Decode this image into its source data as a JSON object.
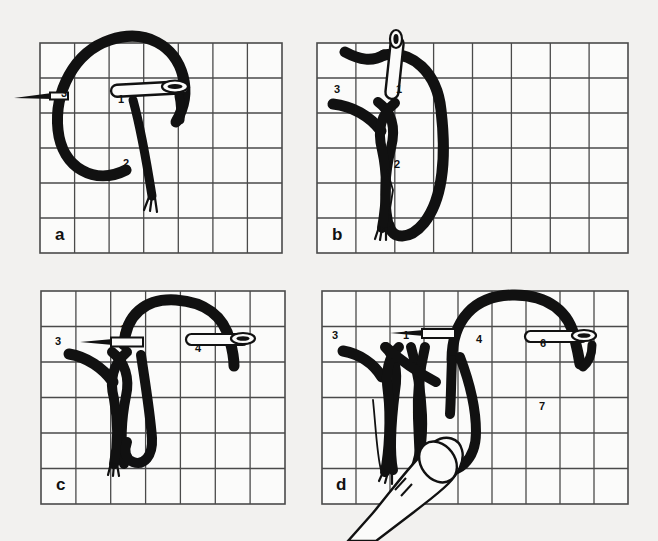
{
  "figure": {
    "background_color": "#f2f1ef",
    "ink_color": "#111111",
    "grid_color": "#4a4a4a",
    "grid_fill": "#fbfbfa"
  },
  "panels": [
    {
      "id": "a",
      "label": "a",
      "grid": {
        "cols": 7,
        "rows": 6,
        "x": 40,
        "y": 43,
        "w": 242,
        "h": 210
      },
      "step_labels": [
        {
          "text": "1",
          "x": 118,
          "y": 103
        },
        {
          "text": "2",
          "x": 123,
          "y": 167
        },
        {
          "text": "3",
          "x": 61,
          "y": 97
        }
      ],
      "needles": [
        {
          "name": "needle-horizontal-left",
          "orientation": "horizontal",
          "eye": "none",
          "tip": "left"
        },
        {
          "name": "needle-horizontal-right",
          "orientation": "horizontal",
          "eye": "right"
        }
      ],
      "panel_label_pos": {
        "x": 55,
        "y": 240
      }
    },
    {
      "id": "b",
      "label": "b",
      "grid": {
        "cols": 8,
        "rows": 6,
        "x": 317,
        "y": 43,
        "w": 311,
        "h": 210
      },
      "step_labels": [
        {
          "text": "1",
          "x": 396,
          "y": 93
        },
        {
          "text": "2",
          "x": 394,
          "y": 168
        },
        {
          "text": "3",
          "x": 334,
          "y": 93
        }
      ],
      "needles": [
        {
          "name": "needle-vertical",
          "orientation": "vertical",
          "eye": "top"
        }
      ],
      "panel_label_pos": {
        "x": 332,
        "y": 240
      }
    },
    {
      "id": "c",
      "label": "c",
      "grid": {
        "cols": 7,
        "rows": 6,
        "x": 41,
        "y": 291,
        "w": 244,
        "h": 213
      },
      "step_labels": [
        {
          "text": "1",
          "x": 120,
          "y": 333
        },
        {
          "text": "2",
          "x": 114,
          "y": 413
        },
        {
          "text": "3",
          "x": 57,
          "y": 345
        },
        {
          "text": "4",
          "x": 196,
          "y": 350
        }
      ],
      "needles": [
        {
          "name": "needle-horizontal-left",
          "orientation": "horizontal",
          "eye": "none",
          "tip": "left"
        },
        {
          "name": "needle-horizontal-right",
          "orientation": "horizontal",
          "eye": "right"
        }
      ],
      "panel_label_pos": {
        "x": 57,
        "y": 489
      }
    },
    {
      "id": "d",
      "label": "d",
      "grid": {
        "cols": 9,
        "rows": 6,
        "x": 322,
        "y": 291,
        "w": 306,
        "h": 213
      },
      "step_labels": [
        {
          "text": "1",
          "x": 405,
          "y": 339
        },
        {
          "text": "2",
          "x": 415,
          "y": 412
        },
        {
          "text": "3",
          "x": 334,
          "y": 339
        },
        {
          "text": "4",
          "x": 478,
          "y": 341
        },
        {
          "text": "5",
          "x": 474,
          "y": 409
        },
        {
          "text": "6",
          "x": 542,
          "y": 345
        },
        {
          "text": "7",
          "x": 541,
          "y": 409
        }
      ],
      "needles": [
        {
          "name": "needle-horizontal-left",
          "orientation": "horizontal",
          "eye": "none",
          "tip": "left"
        },
        {
          "name": "needle-horizontal-right",
          "orientation": "horizontal",
          "eye": "right"
        }
      ],
      "hand": {
        "name": "finger-illustration",
        "x": 360,
        "y": 430
      },
      "panel_label_pos": {
        "x": 336,
        "y": 489
      }
    }
  ]
}
